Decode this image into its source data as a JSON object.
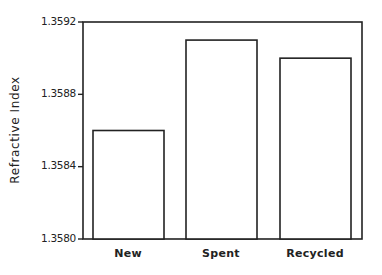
{
  "chart_data": {
    "type": "bar",
    "title": "",
    "xlabel": "",
    "ylabel": "Refractive Index",
    "categories": [
      "New",
      "Spent",
      "Recycled"
    ],
    "values": [
      1.3586,
      1.3591,
      1.359
    ],
    "ylim": [
      1.358,
      1.3592
    ],
    "yticks": [
      "1.3580",
      "1.3584",
      "1.3588",
      "1.3592"
    ],
    "grid": false,
    "legend": null,
    "bar_fill": "#ffffff",
    "bar_stroke": "#222222"
  }
}
